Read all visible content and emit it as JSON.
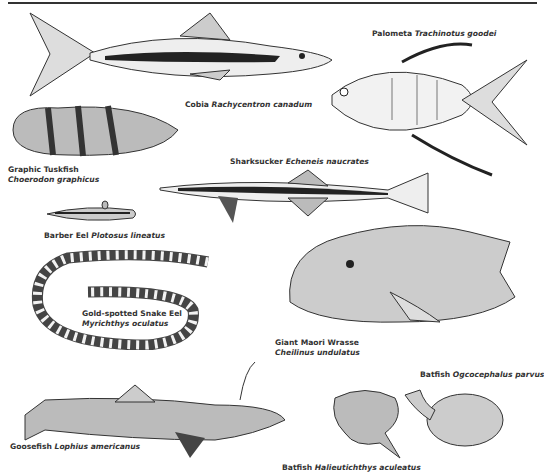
{
  "plate": {
    "species": [
      {
        "id": "cobia",
        "common": "Cobia",
        "scientific": "Rachycentron canadum"
      },
      {
        "id": "palometa",
        "common": "Palometa",
        "scientific": "Trachinotus goodei"
      },
      {
        "id": "tuskfish",
        "common": "Graphic Tuskfish",
        "scientific": "Choerodon graphicus"
      },
      {
        "id": "sharksucker",
        "common": "Sharksucker",
        "scientific": "Echeneis naucrates"
      },
      {
        "id": "barber-eel",
        "common": "Barber Eel",
        "scientific": "Plotosus lineatus"
      },
      {
        "id": "snake-eel",
        "common": "Gold-spotted Snake Eel",
        "scientific": "Myrichthys oculatus"
      },
      {
        "id": "wrasse",
        "common": "Giant Maori Wrasse",
        "scientific": "Cheilinus undulatus"
      },
      {
        "id": "batfish-ogco",
        "common": "Batfish",
        "scientific": "Ogcocephalus parvus"
      },
      {
        "id": "goosefish",
        "common": "Goosefish",
        "scientific": "Lophius americanus"
      },
      {
        "id": "batfish-halieu",
        "common": "Batfish",
        "scientific": "Halieutichthys aculeatus"
      }
    ]
  }
}
